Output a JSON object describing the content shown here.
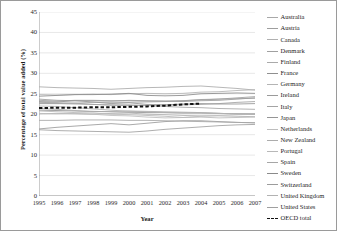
{
  "chart_data": {
    "type": "line",
    "title": "",
    "xlabel": "Year",
    "ylabel": "Percentage of total value added (%)",
    "x": [
      1995,
      1996,
      1997,
      1998,
      1999,
      2000,
      2001,
      2002,
      2003,
      2004,
      2005,
      2006,
      2007
    ],
    "xlim": [
      1995,
      2007
    ],
    "ylim": [
      0,
      45
    ],
    "yticks": [
      0,
      5,
      10,
      15,
      20,
      25,
      30,
      35,
      40,
      45
    ],
    "grid": "horizontal",
    "legend_position": "right",
    "series": [
      {
        "name": "Australia",
        "color": "#a8a8a8",
        "values": [
          22.6,
          22.6,
          22.7,
          22.9,
          22.9,
          22.9,
          23.0,
          23.1,
          23.3,
          23.5,
          23.7,
          23.8,
          23.9
        ]
      },
      {
        "name": "Austria",
        "color": "#9e9e9e",
        "values": [
          23.4,
          23.2,
          23.4,
          23.4,
          23.3,
          23.3,
          23.2,
          23.2,
          23.3,
          23.6,
          23.7,
          24.0,
          24.3
        ]
      },
      {
        "name": "Canada",
        "color": "#b0b0b0",
        "values": [
          20.1,
          20.2,
          20.1,
          20.0,
          20.2,
          20.3,
          20.0,
          19.9,
          19.7,
          19.6,
          19.6,
          19.5,
          19.4
        ]
      },
      {
        "name": "Denmark",
        "color": "#a0a0a0",
        "values": [
          22.9,
          22.8,
          22.7,
          22.4,
          22.2,
          22.1,
          22.2,
          22.2,
          22.3,
          22.4,
          22.6,
          22.9,
          23.1
        ]
      },
      {
        "name": "Finland",
        "color": "#aaaaaa",
        "values": [
          26.7,
          26.5,
          26.4,
          26.3,
          26.1,
          26.3,
          26.5,
          26.6,
          26.8,
          26.9,
          26.6,
          26.3,
          25.9
        ]
      },
      {
        "name": "France",
        "color": "#8f8f8f",
        "values": [
          21.0,
          20.9,
          20.8,
          20.7,
          20.6,
          20.5,
          20.4,
          20.4,
          20.3,
          20.3,
          20.2,
          20.1,
          20.1
        ]
      },
      {
        "name": "Germany",
        "color": "#b4b4b4",
        "values": [
          24.8,
          24.7,
          24.8,
          24.9,
          24.8,
          25.0,
          25.1,
          25.0,
          25.1,
          25.4,
          25.5,
          25.8,
          26.0
        ]
      },
      {
        "name": "Ireland",
        "color": "#9a9a9a",
        "values": [
          16.4,
          16.8,
          17.1,
          17.4,
          17.7,
          17.4,
          17.8,
          18.2,
          18.4,
          18.4,
          18.2,
          18.0,
          17.9
        ]
      },
      {
        "name": "Italy",
        "color": "#a4a4a4",
        "values": [
          22.6,
          22.6,
          22.5,
          22.4,
          22.3,
          22.3,
          22.1,
          21.9,
          21.7,
          21.6,
          21.4,
          21.3,
          21.2
        ]
      },
      {
        "name": "Japan",
        "color": "#959595",
        "values": [
          23.1,
          23.0,
          23.3,
          23.0,
          22.6,
          22.8,
          22.4,
          22.3,
          22.5,
          22.6,
          22.5,
          22.5,
          22.6
        ]
      },
      {
        "name": "Netherlands",
        "color": "#bdbdbd",
        "values": [
          20.2,
          20.1,
          20.2,
          20.0,
          19.7,
          19.6,
          19.3,
          19.1,
          19.2,
          19.5,
          19.7,
          19.9,
          20.0
        ]
      },
      {
        "name": "New Zealand",
        "color": "#acacac",
        "values": [
          21.4,
          21.2,
          20.9,
          20.6,
          20.7,
          20.8,
          20.7,
          20.6,
          20.5,
          20.4,
          20.2,
          20.1,
          20.0
        ]
      },
      {
        "name": "Portugal",
        "color": "#b8b8b8",
        "values": [
          20.8,
          20.6,
          20.4,
          20.3,
          20.0,
          19.9,
          19.7,
          19.5,
          19.2,
          19.3,
          19.1,
          19.2,
          19.3
        ]
      },
      {
        "name": "Spain",
        "color": "#a6a6a6",
        "values": [
          18.5,
          18.5,
          18.6,
          18.6,
          18.6,
          18.5,
          18.5,
          18.4,
          18.3,
          18.2,
          18.1,
          18.0,
          17.9
        ]
      },
      {
        "name": "Sweden",
        "color": "#8a8a8a",
        "values": [
          24.4,
          24.6,
          24.8,
          24.8,
          24.9,
          25.1,
          24.6,
          24.5,
          24.6,
          25.0,
          25.1,
          25.2,
          25.1
        ]
      },
      {
        "name": "Switzerland",
        "color": "#9c9c9c",
        "values": [
          23.7,
          23.4,
          23.3,
          23.3,
          23.2,
          23.4,
          23.3,
          23.2,
          23.1,
          23.3,
          23.4,
          23.7,
          24.0
        ]
      },
      {
        "name": "United Kingdom",
        "color": "#b2b2b2",
        "values": [
          22.0,
          21.9,
          21.6,
          21.3,
          21.0,
          20.7,
          20.6,
          20.4,
          20.3,
          20.3,
          20.2,
          20.1,
          20.0
        ]
      },
      {
        "name": "United States",
        "color": "#9f9f9f",
        "values": [
          16.2,
          16.0,
          15.9,
          15.8,
          15.7,
          15.6,
          15.9,
          16.3,
          16.6,
          16.9,
          17.2,
          17.4,
          17.5
        ]
      }
    ],
    "highlight_series": {
      "name": "OECD total",
      "color": "#111111",
      "style": "dashed",
      "values": [
        21.5,
        21.6,
        21.6,
        21.7,
        21.7,
        21.8,
        21.9,
        22.1,
        22.4,
        22.6,
        null,
        null,
        null
      ]
    },
    "legend": [
      {
        "label": "Australia",
        "style": "solid"
      },
      {
        "label": "Austria",
        "style": "solid"
      },
      {
        "label": "Canada",
        "style": "solid"
      },
      {
        "label": "Denmark",
        "style": "solid"
      },
      {
        "label": "Finland",
        "style": "solid"
      },
      {
        "label": "France",
        "style": "solid"
      },
      {
        "label": "Germany",
        "style": "solid"
      },
      {
        "label": "Ireland",
        "style": "solid"
      },
      {
        "label": "Italy",
        "style": "solid"
      },
      {
        "label": "Japan",
        "style": "solid"
      },
      {
        "label": "Netherlands",
        "style": "solid"
      },
      {
        "label": "New Zealand",
        "style": "solid"
      },
      {
        "label": "Portugal",
        "style": "solid"
      },
      {
        "label": "Spain",
        "style": "solid"
      },
      {
        "label": "Sweden",
        "style": "solid"
      },
      {
        "label": "Switzerland",
        "style": "solid"
      },
      {
        "label": "United Kingdom",
        "style": "solid"
      },
      {
        "label": "United States",
        "style": "solid"
      },
      {
        "label": "OECD total",
        "style": "dashed"
      }
    ]
  }
}
